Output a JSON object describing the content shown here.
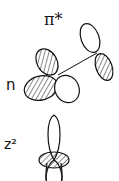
{
  "labels": {
    "pi_star": "π*",
    "n": "n",
    "z2": "z²"
  },
  "colors": {
    "stroke": "#111111",
    "background": "#ffffff"
  }
}
